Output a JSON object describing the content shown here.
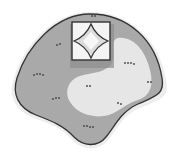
{
  "map": {
    "type": "illustrated-island-map",
    "colors": {
      "background": "#ffffff",
      "halo": "#ececec",
      "land_dark": "#a9a9a9",
      "land_light": "#e6e6e6",
      "outline": "#333333",
      "fort_shadow": "#8f8f8f",
      "fort_fill": "#f4f4f4",
      "fort_inner": "#dcdcdc",
      "marks": "#444444"
    },
    "features": [
      {
        "name": "island-landmass"
      },
      {
        "name": "light-clearing"
      },
      {
        "name": "square-fort"
      },
      {
        "name": "diamond-keep"
      },
      {
        "name": "grass-tufts",
        "count": 9
      }
    ]
  }
}
